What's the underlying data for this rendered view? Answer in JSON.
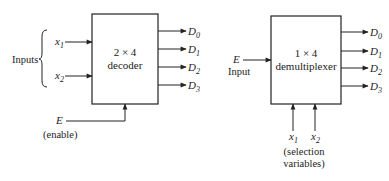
{
  "decoder": {
    "title_line1": "2 × 4",
    "title_line2": "decoder",
    "inputs_label": "Inputs",
    "input_x1": "x",
    "input_x1_sub": "1",
    "input_x2": "x",
    "input_x2_sub": "2",
    "enable_symbol": "E",
    "enable_label": "(enable)",
    "outputs": [
      {
        "name": "D",
        "sub": "0"
      },
      {
        "name": "D",
        "sub": "1"
      },
      {
        "name": "D",
        "sub": "2"
      },
      {
        "name": "D",
        "sub": "3"
      }
    ]
  },
  "demultiplexer": {
    "title_line1": "1 × 4",
    "title_line2": "demultiplexer",
    "input_symbol": "E",
    "input_label": "Input",
    "select_x1": "x",
    "select_x1_sub": "1",
    "select_x2": "x",
    "select_x2_sub": "2",
    "select_label_line1": "(selection",
    "select_label_line2": "variables)",
    "outputs": [
      {
        "name": "D",
        "sub": "0"
      },
      {
        "name": "D",
        "sub": "1"
      },
      {
        "name": "D",
        "sub": "2"
      },
      {
        "name": "D",
        "sub": "3"
      }
    ]
  },
  "colors": {
    "stroke": "#222222",
    "background": "#ffffff"
  }
}
